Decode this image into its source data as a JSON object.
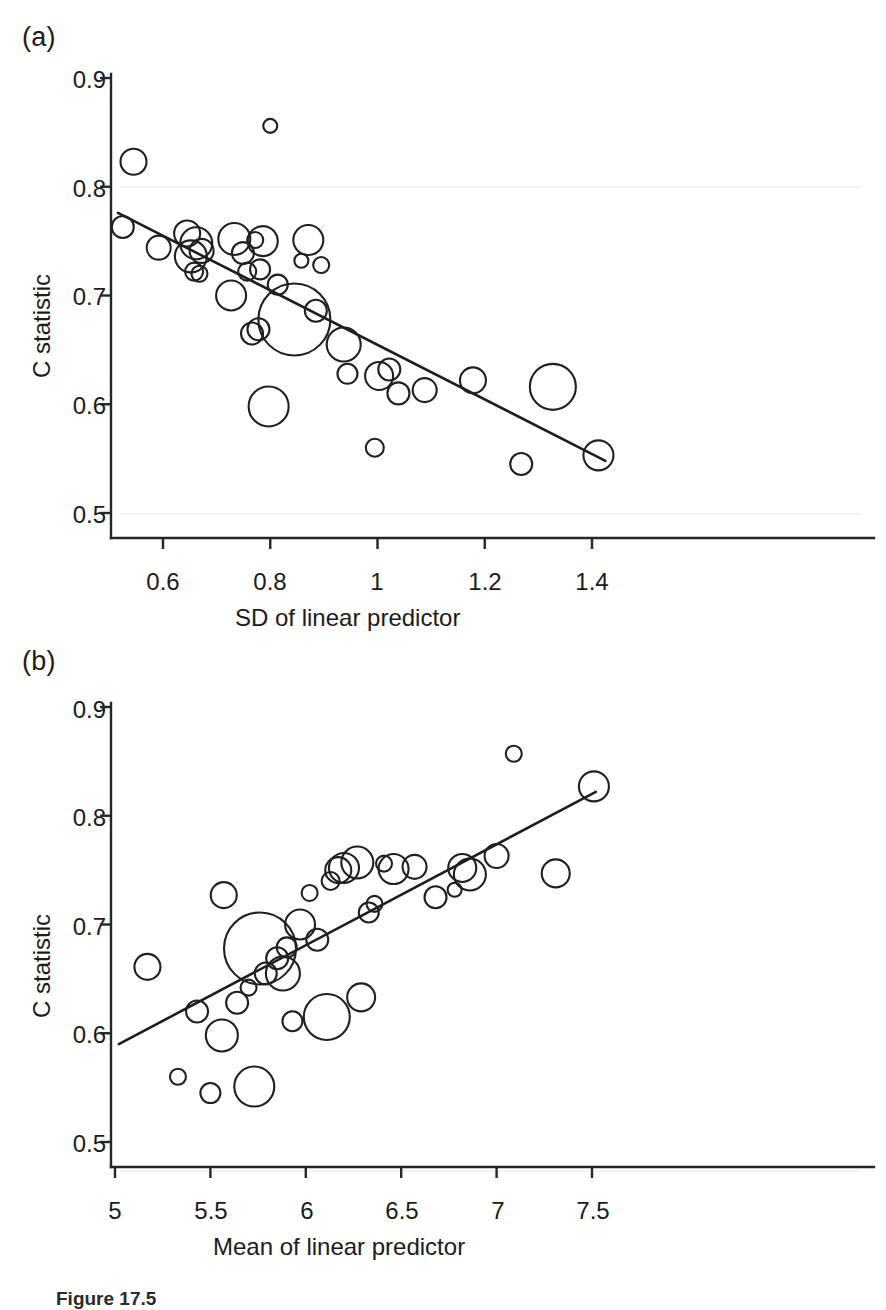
{
  "figure": {
    "caption_partial": "Figure 17.5",
    "panels": [
      {
        "letter": "(a)"
      },
      {
        "letter": "(b)"
      }
    ]
  },
  "chart_data": [
    {
      "type": "scatter",
      "panel": "(a)",
      "title": "",
      "xlabel": "SD of linear predictor",
      "ylabel": "C statistic",
      "xlim": [
        0.51,
        1.43
      ],
      "ylim": [
        0.49,
        0.905
      ],
      "xticks": [
        0.6,
        0.8,
        1.0,
        1.2,
        1.4
      ],
      "xtick_labels": [
        "0.6",
        "0.8",
        "1",
        "1.2",
        "1.4"
      ],
      "yticks": [
        0.5,
        0.6,
        0.7,
        0.8,
        0.9
      ],
      "ytick_labels": [
        "0.5",
        "0.6",
        "0.7",
        "0.8",
        "0.9"
      ],
      "grid": false,
      "marker": "open-circle",
      "size_encoding": "study weight (bubble area)",
      "points": [
        {
          "x": 0.525,
          "y": 0.637,
          "r": 11
        },
        {
          "x": 0.545,
          "y": 0.577,
          "r": 13
        },
        {
          "x": 0.592,
          "y": 0.656,
          "r": 12
        },
        {
          "x": 0.645,
          "y": 0.643,
          "r": 13
        },
        {
          "x": 0.652,
          "y": 0.664,
          "r": 16
        },
        {
          "x": 0.658,
          "y": 0.678,
          "r": 9
        },
        {
          "x": 0.662,
          "y": 0.652,
          "r": 16
        },
        {
          "x": 0.668,
          "y": 0.68,
          "r": 8
        },
        {
          "x": 0.672,
          "y": 0.659,
          "r": 12
        },
        {
          "x": 0.727,
          "y": 0.7,
          "r": 15
        },
        {
          "x": 0.733,
          "y": 0.648,
          "r": 16
        },
        {
          "x": 0.749,
          "y": 0.661,
          "r": 11
        },
        {
          "x": 0.757,
          "y": 0.678,
          "r": 9
        },
        {
          "x": 0.766,
          "y": 0.735,
          "r": 11
        },
        {
          "x": 0.772,
          "y": 0.649,
          "r": 8
        },
        {
          "x": 0.778,
          "y": 0.731,
          "r": 11
        },
        {
          "x": 0.781,
          "y": 0.676,
          "r": 10
        },
        {
          "x": 0.786,
          "y": 0.65,
          "r": 15
        },
        {
          "x": 0.797,
          "y": 0.802,
          "r": 20
        },
        {
          "x": 0.8,
          "y": 0.544,
          "r": 7
        },
        {
          "x": 0.814,
          "y": 0.69,
          "r": 10
        },
        {
          "x": 0.845,
          "y": 0.722,
          "r": 36
        },
        {
          "x": 0.858,
          "y": 0.668,
          "r": 7
        },
        {
          "x": 0.871,
          "y": 0.649,
          "r": 15
        },
        {
          "x": 0.885,
          "y": 0.714,
          "r": 11
        },
        {
          "x": 0.895,
          "y": 0.672,
          "r": 8
        },
        {
          "x": 0.937,
          "y": 0.745,
          "r": 17
        },
        {
          "x": 0.944,
          "y": 0.772,
          "r": 10
        },
        {
          "x": 0.995,
          "y": 0.84,
          "r": 9
        },
        {
          "x": 1.003,
          "y": 0.774,
          "r": 14
        },
        {
          "x": 1.022,
          "y": 0.768,
          "r": 11
        },
        {
          "x": 1.039,
          "y": 0.79,
          "r": 11
        },
        {
          "x": 1.088,
          "y": 0.787,
          "r": 12
        },
        {
          "x": 1.178,
          "y": 0.778,
          "r": 13
        },
        {
          "x": 1.268,
          "y": 0.855,
          "r": 11
        },
        {
          "x": 1.327,
          "y": 0.784,
          "r": 23
        },
        {
          "x": 1.412,
          "y": 0.847,
          "r": 15
        }
      ],
      "fit_line": {
        "x1": 0.516,
        "y1": 0.624,
        "x2": 1.425,
        "y2": 0.852
      }
    },
    {
      "type": "scatter",
      "panel": "(b)",
      "title": "",
      "xlabel": "Mean of linear predictor",
      "ylabel": "C statistic",
      "xlim": [
        4.95,
        7.57
      ],
      "ylim": [
        0.49,
        0.905
      ],
      "xticks": [
        5,
        5.5,
        6,
        6.5,
        7,
        7.5
      ],
      "xtick_labels": [
        "5",
        "5.5",
        "6",
        "6.5",
        "7",
        "7.5"
      ],
      "yticks": [
        0.5,
        0.6,
        0.7,
        0.8,
        0.9
      ],
      "ytick_labels": [
        "0.5",
        "0.6",
        "0.7",
        "0.8",
        "0.9"
      ],
      "grid": false,
      "marker": "open-circle",
      "size_encoding": "study weight (bubble area)",
      "points": [
        {
          "x": 5.17,
          "y": 0.739,
          "r": 13
        },
        {
          "x": 5.33,
          "y": 0.84,
          "r": 8
        },
        {
          "x": 5.43,
          "y": 0.78,
          "r": 11
        },
        {
          "x": 5.5,
          "y": 0.855,
          "r": 10
        },
        {
          "x": 5.56,
          "y": 0.802,
          "r": 16
        },
        {
          "x": 5.57,
          "y": 0.673,
          "r": 13
        },
        {
          "x": 5.64,
          "y": 0.772,
          "r": 11
        },
        {
          "x": 5.7,
          "y": 0.758,
          "r": 8
        },
        {
          "x": 5.73,
          "y": 0.849,
          "r": 20
        },
        {
          "x": 5.76,
          "y": 0.722,
          "r": 36
        },
        {
          "x": 5.79,
          "y": 0.745,
          "r": 11
        },
        {
          "x": 5.85,
          "y": 0.731,
          "r": 11
        },
        {
          "x": 5.88,
          "y": 0.745,
          "r": 17
        },
        {
          "x": 5.9,
          "y": 0.721,
          "r": 10
        },
        {
          "x": 5.93,
          "y": 0.789,
          "r": 10
        },
        {
          "x": 5.97,
          "y": 0.7,
          "r": 15
        },
        {
          "x": 6.02,
          "y": 0.671,
          "r": 8
        },
        {
          "x": 6.06,
          "y": 0.714,
          "r": 11
        },
        {
          "x": 6.11,
          "y": 0.785,
          "r": 23
        },
        {
          "x": 6.13,
          "y": 0.66,
          "r": 9
        },
        {
          "x": 6.17,
          "y": 0.65,
          "r": 13
        },
        {
          "x": 6.2,
          "y": 0.648,
          "r": 15
        },
        {
          "x": 6.27,
          "y": 0.643,
          "r": 16
        },
        {
          "x": 6.29,
          "y": 0.767,
          "r": 14
        },
        {
          "x": 6.33,
          "y": 0.689,
          "r": 10
        },
        {
          "x": 6.36,
          "y": 0.681,
          "r": 8
        },
        {
          "x": 6.41,
          "y": 0.644,
          "r": 8
        },
        {
          "x": 6.46,
          "y": 0.649,
          "r": 15
        },
        {
          "x": 6.57,
          "y": 0.647,
          "r": 12
        },
        {
          "x": 6.68,
          "y": 0.675,
          "r": 11
        },
        {
          "x": 6.78,
          "y": 0.668,
          "r": 7
        },
        {
          "x": 6.82,
          "y": 0.648,
          "r": 14
        },
        {
          "x": 6.86,
          "y": 0.654,
          "r": 16
        },
        {
          "x": 7.0,
          "y": 0.637,
          "r": 12
        },
        {
          "x": 7.09,
          "y": 0.543,
          "r": 8
        },
        {
          "x": 7.31,
          "y": 0.653,
          "r": 14
        },
        {
          "x": 7.51,
          "y": 0.573,
          "r": 15
        }
      ],
      "fit_line": {
        "x1": 5.02,
        "y1": 0.81,
        "x2": 7.52,
        "y2": 0.578
      }
    }
  ]
}
